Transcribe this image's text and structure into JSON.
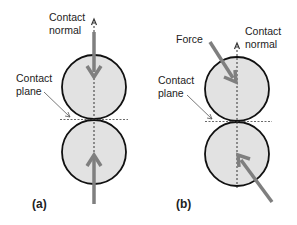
{
  "colors": {
    "circle_fill": "#e2e2e2",
    "circle_stroke": "#111111",
    "force_arrow": "#7f7f7f",
    "dashed_line": "#333333",
    "leader_line": "#555555"
  },
  "panels": [
    {
      "id": "a",
      "panel_label": "(a)",
      "normal_label": [
        "Contact",
        "normal"
      ],
      "plane_label": [
        "Contact",
        "plane"
      ],
      "force_direction": "aligned with contact normal"
    },
    {
      "id": "b",
      "panel_label": "(b)",
      "force_label": "Force",
      "normal_label": [
        "Contact",
        "normal"
      ],
      "plane_label": [
        "Contact",
        "plane"
      ],
      "force_direction": "oblique to contact normal"
    }
  ]
}
